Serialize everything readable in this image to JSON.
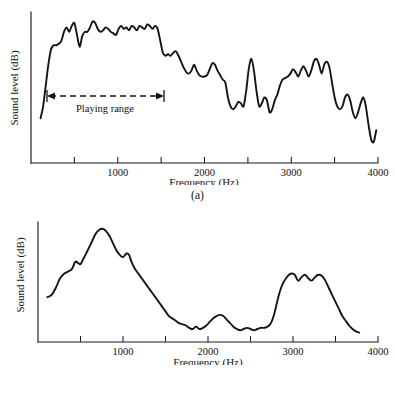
{
  "figure": {
    "background_color": "#ffffff",
    "ink_color": "#141414"
  },
  "panels": [
    {
      "id": "a",
      "caption": "(a)",
      "xlabel": "Frequency (Hz)",
      "ylabel": "Sound level (dB)",
      "tick_labels": [
        "1000",
        "2000",
        "3000",
        "4000"
      ],
      "annotation": {
        "label": "Playing range",
        "style": "dashed double-headed arrow"
      }
    },
    {
      "id": "b",
      "caption": "(b)",
      "xlabel": "Frequency (Hz)",
      "ylabel": "Sound level (dB)",
      "tick_labels": [
        "1000",
        "2000",
        "3000",
        "4000"
      ]
    }
  ],
  "chart_data": [
    {
      "type": "line",
      "title": "(a)",
      "xlabel": "Frequency (Hz)",
      "ylabel": "Sound level (dB)",
      "xlim": [
        0,
        4000
      ],
      "ylim": [
        0,
        100
      ],
      "xticks": [
        500,
        1000,
        1500,
        2000,
        2500,
        3000,
        3500,
        4000
      ],
      "xticklabels": [
        "",
        "1000",
        "",
        "2000",
        "",
        "3000",
        "",
        "4000"
      ],
      "yticks": [],
      "grid": false,
      "legend": null,
      "annotations": [
        {
          "text": "Playing range",
          "type": "double-arrow-dashed",
          "x_start": 190,
          "x_end": 1530,
          "y": 48
        }
      ],
      "x": [
        110,
        140,
        170,
        200,
        230,
        260,
        290,
        320,
        350,
        380,
        410,
        440,
        470,
        500,
        530,
        560,
        590,
        620,
        650,
        680,
        710,
        740,
        770,
        800,
        830,
        860,
        890,
        920,
        950,
        980,
        1010,
        1040,
        1070,
        1100,
        1130,
        1160,
        1190,
        1220,
        1250,
        1280,
        1310,
        1340,
        1370,
        1400,
        1430,
        1460,
        1490,
        1520,
        1550,
        1580,
        1610,
        1640,
        1670,
        1700,
        1730,
        1760,
        1790,
        1820,
        1850,
        1880,
        1910,
        1940,
        1970,
        2000,
        2030,
        2060,
        2090,
        2120,
        2150,
        2180,
        2210,
        2240,
        2270,
        2300,
        2330,
        2360,
        2390,
        2420,
        2450,
        2480,
        2510,
        2540,
        2570,
        2600,
        2630,
        2660,
        2690,
        2720,
        2750,
        2780,
        2810,
        2840,
        2870,
        2900,
        2930,
        2960,
        2990,
        3020,
        3050,
        3080,
        3110,
        3140,
        3170,
        3200,
        3230,
        3260,
        3290,
        3320,
        3350,
        3380,
        3410,
        3440,
        3470,
        3500,
        3530,
        3560,
        3590,
        3620,
        3650,
        3680,
        3710,
        3740,
        3770,
        3800,
        3830,
        3860,
        3890,
        3920,
        3950,
        3980
      ],
      "y": [
        30,
        38,
        52,
        66,
        76,
        79,
        79,
        80,
        82,
        88,
        91,
        88,
        92,
        94,
        86,
        78,
        85,
        88,
        88,
        91,
        95,
        94,
        90,
        88,
        89,
        91,
        90,
        88,
        87,
        86,
        90,
        92,
        90,
        91,
        89,
        92,
        91,
        89,
        92,
        91,
        90,
        93,
        92,
        90,
        92,
        90,
        82,
        74,
        72,
        73,
        72,
        74,
        75,
        72,
        68,
        64,
        61,
        60,
        62,
        66,
        62,
        59,
        58,
        58,
        59,
        63,
        67,
        66,
        62,
        59,
        56,
        54,
        44,
        38,
        36,
        38,
        41,
        40,
        38,
        48,
        63,
        70,
        62,
        48,
        38,
        40,
        44,
        42,
        34,
        36,
        42,
        46,
        52,
        56,
        57,
        58,
        60,
        63,
        61,
        58,
        62,
        65,
        62,
        58,
        62,
        68,
        70,
        66,
        60,
        66,
        68,
        64,
        54,
        44,
        38,
        36,
        38,
        44,
        46,
        42,
        34,
        30,
        34,
        40,
        44,
        38,
        26,
        16,
        14,
        22,
        34
      ]
    },
    {
      "type": "line",
      "title": "(b)",
      "xlabel": "Frequency (Hz)",
      "ylabel": "Sound level (dB)",
      "xlim": [
        0,
        4000
      ],
      "ylim": [
        0,
        100
      ],
      "xticks": [
        500,
        1000,
        1500,
        2000,
        2500,
        3000,
        3500,
        4000
      ],
      "xticklabels": [
        "",
        "1000",
        "",
        "2000",
        "",
        "3000",
        "",
        "4000"
      ],
      "yticks": [],
      "grid": false,
      "legend": null,
      "annotations": [],
      "x": [
        110,
        160,
        210,
        260,
        310,
        360,
        400,
        440,
        470,
        500,
        530,
        560,
        600,
        640,
        680,
        720,
        760,
        800,
        840,
        880,
        920,
        960,
        1000,
        1040,
        1070,
        1100,
        1140,
        1180,
        1220,
        1260,
        1300,
        1340,
        1380,
        1420,
        1460,
        1500,
        1540,
        1580,
        1620,
        1660,
        1700,
        1740,
        1780,
        1820,
        1860,
        1900,
        1940,
        1980,
        2020,
        2060,
        2100,
        2140,
        2180,
        2220,
        2260,
        2300,
        2340,
        2380,
        2420,
        2460,
        2500,
        2540,
        2580,
        2620,
        2660,
        2700,
        2740,
        2780,
        2820,
        2860,
        2900,
        2940,
        2980,
        3020,
        3060,
        3100,
        3140,
        3180,
        3220,
        3260,
        3300,
        3340,
        3380,
        3420,
        3460,
        3500,
        3540,
        3580,
        3620,
        3660,
        3700,
        3740,
        3780
      ],
      "y": [
        38,
        40,
        46,
        54,
        58,
        60,
        62,
        68,
        67,
        66,
        70,
        74,
        80,
        86,
        92,
        95,
        96,
        94,
        90,
        84,
        78,
        74,
        72,
        75,
        74,
        68,
        62,
        58,
        54,
        50,
        46,
        42,
        38,
        34,
        30,
        26,
        22,
        20,
        18,
        16,
        15,
        14,
        12,
        11,
        13,
        11,
        12,
        14,
        17,
        20,
        22,
        23,
        22,
        19,
        16,
        13,
        11,
        10,
        11,
        12,
        11,
        10,
        11,
        12,
        12,
        13,
        16,
        24,
        36,
        46,
        52,
        56,
        58,
        57,
        52,
        55,
        57,
        54,
        52,
        55,
        57,
        56,
        52,
        46,
        40,
        34,
        28,
        22,
        18,
        14,
        11,
        9,
        8
      ]
    }
  ]
}
